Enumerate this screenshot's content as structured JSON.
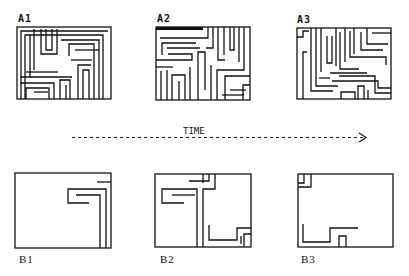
{
  "panels": {
    "A1": {
      "label": "A1"
    },
    "A2": {
      "label": "A2"
    },
    "A3": {
      "label": "A3"
    },
    "B1": {
      "label": "B1"
    },
    "B2": {
      "label": "B2"
    },
    "B3": {
      "label": "B3"
    }
  },
  "timeline": {
    "label": "TIME",
    "direction": "left-to-right"
  },
  "colors": {
    "ink": "#111111",
    "background": "#ffffff"
  }
}
